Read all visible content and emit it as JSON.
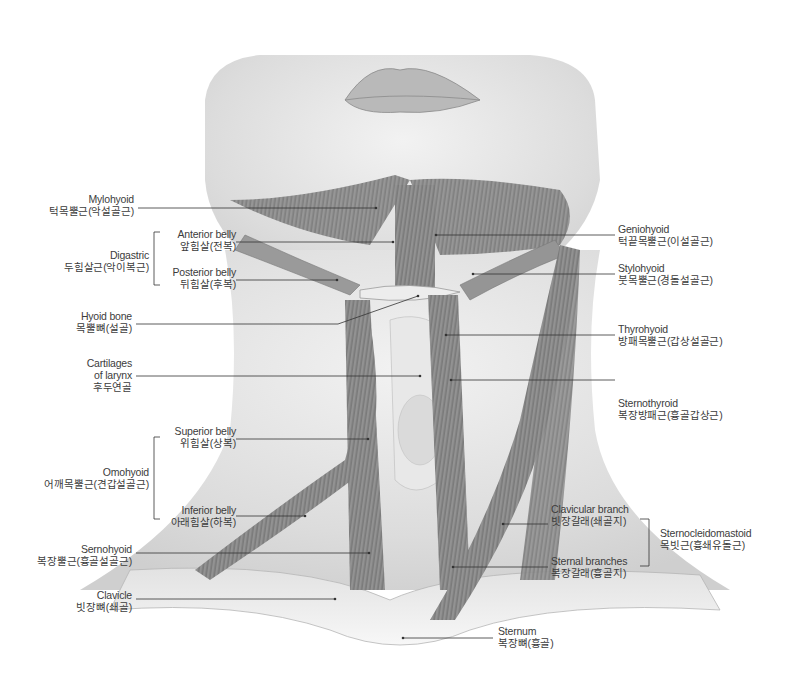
{
  "figure": {
    "colors": {
      "background": "#ffffff",
      "skin_light": "#ececec",
      "skin_mid": "#d9d9d9",
      "muscle": "#8c8c8c",
      "muscle_dark": "#6e6e6e",
      "bone": "#e6e6e6",
      "leader_line": "#333333",
      "text": "#3c3c3c"
    }
  },
  "labels_left": [
    {
      "en": "Mylohyoid",
      "ko": "턱목뿔근(악설골근)"
    },
    {
      "group_en": "Digastric",
      "group_ko": "두힘살근(악이복근)",
      "parts": [
        {
          "en": "Anterior belly",
          "ko": "앞힘살(전복)"
        },
        {
          "en": "Posterior belly",
          "ko": "뒤힘살(후복)"
        }
      ]
    },
    {
      "en": "Hyoid bone",
      "ko": "목뿔뼈(설골)"
    },
    {
      "en": "Cartilages",
      "en2": "of larynx",
      "ko": "후두연골"
    },
    {
      "group_en": "Omohyoid",
      "group_ko": "어깨목뿔근(견갑설골근)",
      "parts": [
        {
          "en": "Superior belly",
          "ko": "위힘살(상복)"
        },
        {
          "en": "Inferior belly",
          "ko": "아래힘살(하복)"
        }
      ]
    },
    {
      "en": "Sernohyoid",
      "ko": "복장뿔근(흉골설골근)"
    },
    {
      "en": "Clavicle",
      "ko": "빗장뼈(쇄골)"
    }
  ],
  "labels_right": [
    {
      "en": "Geniohyoid",
      "ko": "턱끝목뿔근(이설골근)"
    },
    {
      "en": "Stylohyoid",
      "ko": "붓목뿔근(경돌설골근)"
    },
    {
      "en": "Thyrohyoid",
      "ko": "방패목뿔근(갑상설골근)"
    },
    {
      "en": "Sternothyroid",
      "ko": "복장방패근(흉골갑상근)"
    },
    {
      "group_en": "Sternocleidomastoid",
      "group_ko": "목빗근(흉쇄유돌근)",
      "parts": [
        {
          "en": "Clavicular branch",
          "ko": "빗장갈래(쇄골지)"
        },
        {
          "en": "Sternal branches",
          "ko": "복장갈래(흉골지)"
        }
      ]
    }
  ],
  "labels_bottom": [
    {
      "en": "Sternum",
      "ko": "복장뼈(흉골)"
    }
  ]
}
